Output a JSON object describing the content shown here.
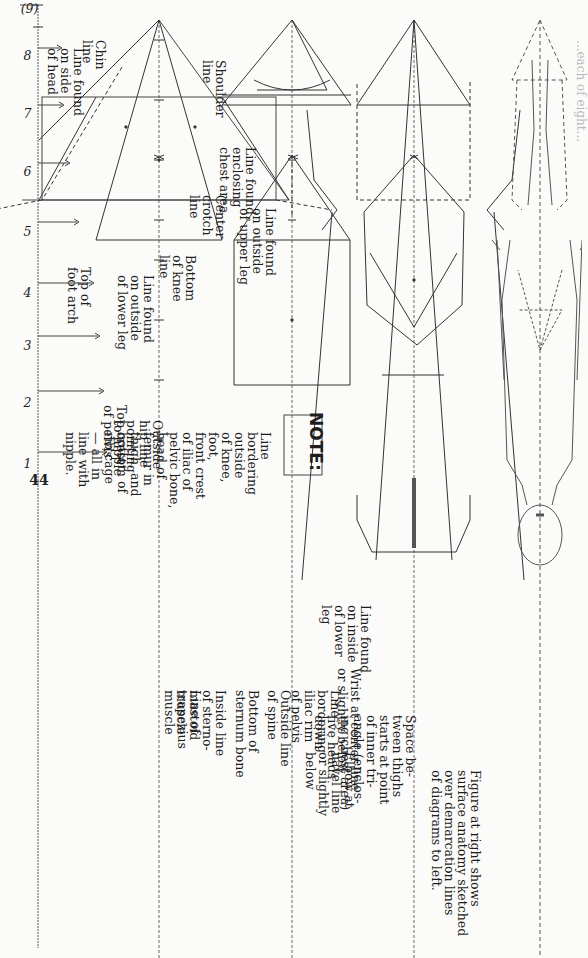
{
  "page": {
    "figure_number": "(9)",
    "page_number": "44",
    "header_fragment": "...each of eight..."
  },
  "scale": {
    "marks": [
      "1",
      "2",
      "3",
      "4",
      "5",
      "6",
      "7",
      "8"
    ]
  },
  "diagram_1": {
    "labels": {
      "chin_line": "Chin\nline",
      "shoulder_line": "Shoulder\nline",
      "line_side_head": "Line found\non side\nof head",
      "line_chest": "Line found\nenclosing\nchest area",
      "center_crotch": "Center\ncrotch\nline",
      "outside_upper_leg": "Line found\non outside\nof upper leg"
    }
  },
  "diagram_2": {
    "labels": {
      "top_crest_pelvis": "Top crest\nof pelvis",
      "outside_hip": "Outside\nhip line\npointing\nto nipple",
      "bottom_knee": "Bottom\nof knee\nline",
      "outside_lower_leg": "Line found\non outside\nof lower leg",
      "top_foot_arch": "Top of\nfoot arch"
    },
    "note": {
      "heading": "NOTE:",
      "body": "Line\nbordering\noutside\nof knee,\nfoot,\nfront crest\nof iliac of\npelvic bone,\nhead of\nfemur in\nthigh, and\nbottom of\nrib cage\n— all in\nline with\nnipple."
    }
  },
  "diagram_3": {
    "labels": {
      "trapezius": "Line of\ntrapezius\nmuscle",
      "sterno_mastoid": "Inside line\nof sterno-\nmastoid\nmuscle",
      "sternum": "Bottom of\nsternum bone",
      "outside_spine": "Outside line\nof spine",
      "iliac_rim": "Line\nbordering\niliac rim\nof pelvis",
      "inside_lower_leg": "Line found\non inside\nof lower\nleg"
    }
  },
  "diagram_4": {
    "labels": {
      "elbow": "Elbow at\nnavel line\nor slightly\nbelow",
      "wrist": "Wrist at center line\nor slightly below",
      "space_thighs": "Space be-\ntween thighs\nstarts at point\nof inner tri-\nangle (enclos-\ning chest area)\nfive heads\ndown",
      "caption": "Figure at right shows\nsurface anatomy sketched\nover demarcation lines\nof diagrams to left."
    }
  }
}
